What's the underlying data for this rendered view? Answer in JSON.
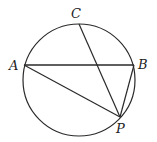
{
  "diagram": {
    "type": "circle-geometry",
    "circle": {
      "cx": 79,
      "cy": 80,
      "r": 56,
      "stroke": "#2a2a2a"
    },
    "points": {
      "A": {
        "label": "A",
        "x": 24,
        "y": 65,
        "lx": 9,
        "ly": 70
      },
      "B": {
        "label": "B",
        "x": 134,
        "y": 65,
        "lx": 138,
        "ly": 69
      },
      "C": {
        "label": "C",
        "x": 79,
        "y": 24,
        "lx": 71,
        "ly": 18
      },
      "P": {
        "label": "P",
        "x": 120,
        "y": 117,
        "lx": 116,
        "ly": 133
      }
    },
    "segments": [
      {
        "from": "A",
        "to": "B"
      },
      {
        "from": "A",
        "to": "P"
      },
      {
        "from": "C",
        "to": "P"
      },
      {
        "from": "B",
        "to": "P"
      }
    ]
  }
}
